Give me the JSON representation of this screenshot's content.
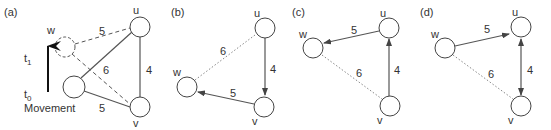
{
  "panels": [
    {
      "id": "a",
      "label": "(a)",
      "nodes": {
        "u": "u",
        "v": "v",
        "w": "w"
      },
      "edge_weights": {
        "wu_dashed": "5",
        "wv_dashed": "6",
        "w0u": "6",
        "w0v": "5",
        "uv": "4"
      },
      "time_labels": {
        "t1": "t",
        "t1_sub": "1",
        "t0": "t",
        "t0_sub": "0"
      },
      "movement_label": "Movement"
    },
    {
      "id": "b",
      "label": "(b)",
      "nodes": {
        "u": "u",
        "v": "v",
        "w": "w"
      },
      "edge_weights": {
        "uw": "6",
        "uv": "4",
        "vw": "5"
      },
      "edges": [
        {
          "from": "u",
          "to": "w",
          "style": "dotted",
          "directed": false
        },
        {
          "from": "u",
          "to": "v",
          "style": "solid",
          "directed": true
        },
        {
          "from": "v",
          "to": "w",
          "style": "solid",
          "directed": true
        }
      ]
    },
    {
      "id": "c",
      "label": "(c)",
      "nodes": {
        "u": "u",
        "v": "v",
        "w": "w"
      },
      "edge_weights": {
        "uw": "5",
        "vw": "6",
        "vu": "4"
      },
      "edges": [
        {
          "from": "u",
          "to": "w",
          "style": "solid",
          "directed": true
        },
        {
          "from": "v",
          "to": "w",
          "style": "dotted",
          "directed": false
        },
        {
          "from": "v",
          "to": "u",
          "style": "solid",
          "directed": true
        }
      ]
    },
    {
      "id": "d",
      "label": "(d)",
      "nodes": {
        "u": "u",
        "v": "v",
        "w": "w"
      },
      "edge_weights": {
        "wu": "5",
        "wv": "6",
        "uv": "4"
      },
      "edges": [
        {
          "from": "w",
          "to": "u",
          "style": "solid",
          "directed": true
        },
        {
          "from": "w",
          "to": "v",
          "style": "dotted",
          "directed": false
        },
        {
          "from": "u",
          "to": "v",
          "style": "solid",
          "directed": "both"
        }
      ]
    }
  ]
}
